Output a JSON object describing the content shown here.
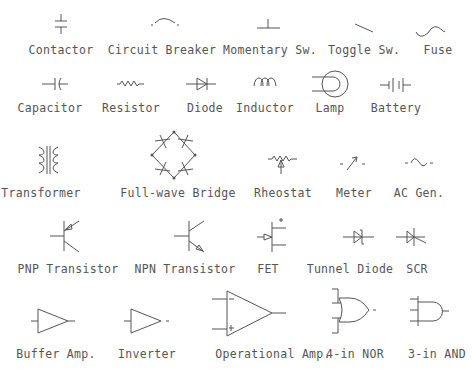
{
  "rows": [
    {
      "symbols": [
        {
          "id": "contactor",
          "label": "Contactor",
          "x": 61,
          "y": 44
        },
        {
          "id": "circuit-breaker",
          "label": "Circuit Breaker",
          "x": 162,
          "y": 44
        },
        {
          "id": "momentary-switch",
          "label": "Momentary Sw.",
          "x": 270,
          "y": 44
        },
        {
          "id": "toggle-switch",
          "label": "Toggle Sw.",
          "x": 364,
          "y": 44
        },
        {
          "id": "fuse",
          "label": "Fuse",
          "x": 438,
          "y": 44
        }
      ]
    },
    {
      "symbols": [
        {
          "id": "capacitor",
          "label": "Capacitor",
          "x": 50,
          "y": 101
        },
        {
          "id": "resistor",
          "label": "Resistor",
          "x": 131,
          "y": 101
        },
        {
          "id": "diode",
          "label": "Diode",
          "x": 205,
          "y": 101
        },
        {
          "id": "inductor",
          "label": "Inductor",
          "x": 265,
          "y": 101
        },
        {
          "id": "lamp",
          "label": "Lamp",
          "x": 330,
          "y": 101
        },
        {
          "id": "battery",
          "label": "Battery",
          "x": 396,
          "y": 101
        }
      ]
    },
    {
      "symbols": [
        {
          "id": "transformer",
          "label": "Transformer",
          "x": 41,
          "y": 186
        },
        {
          "id": "full-wave-bridge",
          "label": "Full-wave Bridge",
          "x": 178,
          "y": 186
        },
        {
          "id": "rheostat",
          "label": "Rheostat",
          "x": 283,
          "y": 186
        },
        {
          "id": "meter",
          "label": "Meter",
          "x": 354,
          "y": 186
        },
        {
          "id": "ac-generator",
          "label": "AC Gen.",
          "x": 419,
          "y": 186
        }
      ]
    },
    {
      "symbols": [
        {
          "id": "pnp-transistor",
          "label": "PNP Transistor",
          "x": 68,
          "y": 262
        },
        {
          "id": "npn-transistor",
          "label": "NPN Transistor",
          "x": 185,
          "y": 262
        },
        {
          "id": "fet",
          "label": "FET",
          "x": 268,
          "y": 262
        },
        {
          "id": "tunnel-diode",
          "label": "Tunnel Diode",
          "x": 350,
          "y": 262
        },
        {
          "id": "scr",
          "label": "SCR",
          "x": 417,
          "y": 262
        }
      ]
    },
    {
      "symbols": [
        {
          "id": "buffer-amp",
          "label": "Buffer Amp.",
          "x": 56,
          "y": 347
        },
        {
          "id": "inverter",
          "label": "Inverter",
          "x": 147,
          "y": 347
        },
        {
          "id": "operational-amp",
          "label": "Operational Amp.",
          "x": 273,
          "y": 347
        },
        {
          "id": "4-in-nor",
          "label": "4-in NOR",
          "x": 355,
          "y": 347
        },
        {
          "id": "3-in-and",
          "label": "3-in AND",
          "x": 437,
          "y": 347
        }
      ]
    }
  ]
}
